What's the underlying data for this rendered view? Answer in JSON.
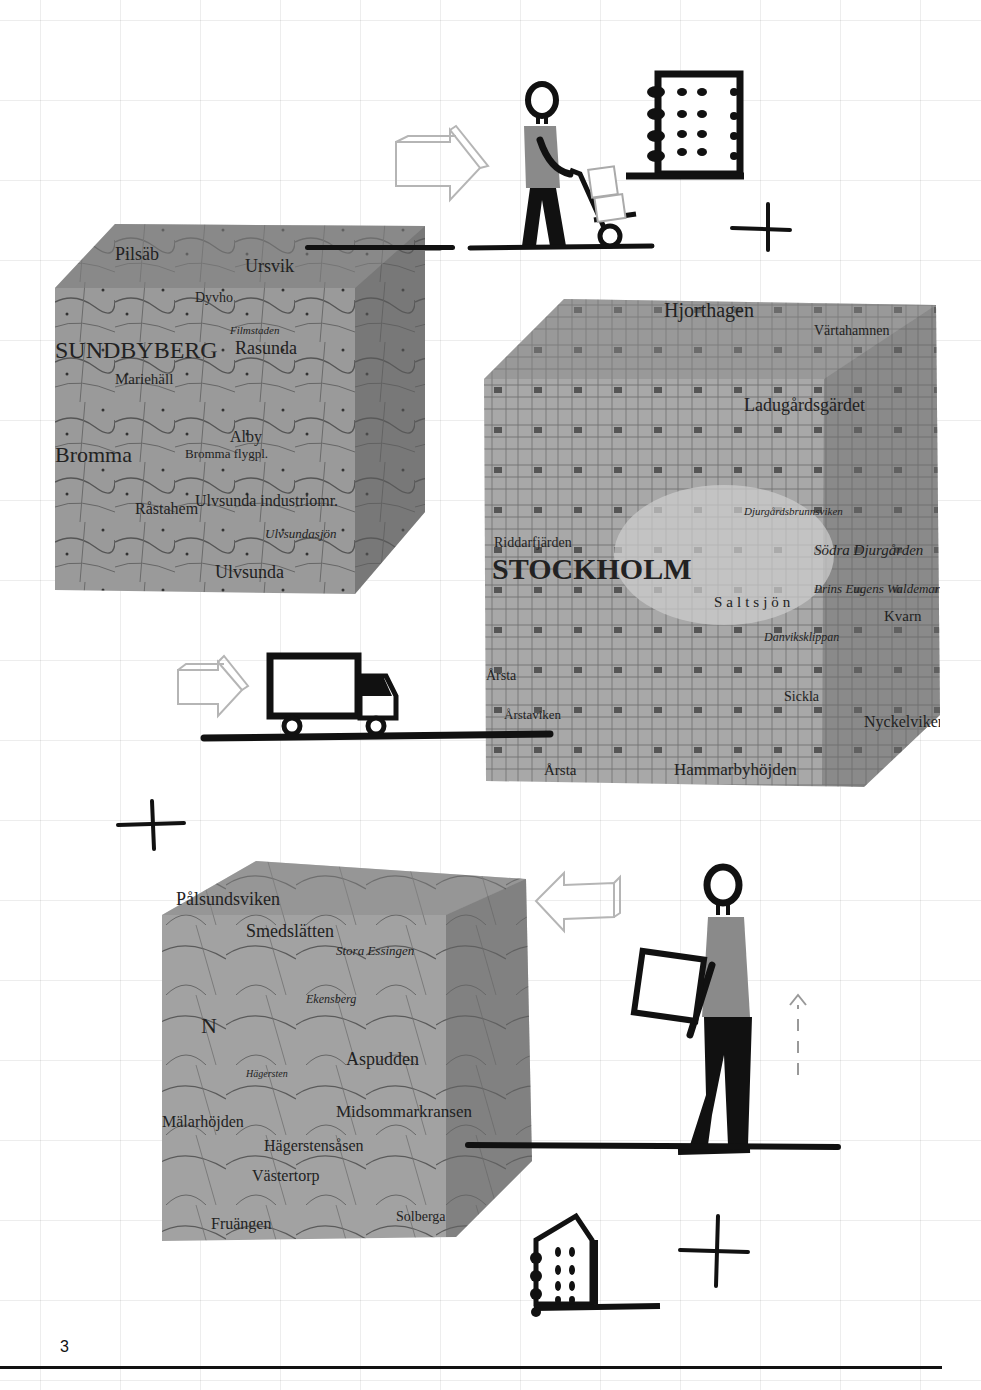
{
  "page": {
    "number": "3",
    "background": "#ffffff",
    "grid_color": "#e6e6e6",
    "ink_color": "#111111",
    "map_tone": "#8c8c8c",
    "arrow_outline_color": "#b5b5b5"
  },
  "cubes": [
    {
      "id": "bromma",
      "labels": [
        "Ulvsunda",
        "Bromma",
        "Mariehäll",
        "SUNDBYBERG",
        "Rasunda",
        "Ulvsunda industriomr.",
        "Alby",
        "Bromma flygpl.",
        "Filmstaden",
        "Dyvho",
        "Råstahem",
        "Ursvik",
        "Ulvsundasjön",
        "Pilsäb"
      ]
    },
    {
      "id": "stockholm",
      "labels": [
        "STOCKHOLM",
        "Hjorthagen",
        "Värtahamnen",
        "Ladugårdsgärdet",
        "Riddarfjärden",
        "Saltsjön",
        "Södra Djurgården",
        "Prins Eugens Waldemarsudde",
        "Djurgårdsbrunnsviken",
        "Danviksklippan",
        "Sickla",
        "Nyckelviken",
        "Hammarbyhöjden",
        "Årsta",
        "Årstaviken",
        "Kvarn"
      ]
    },
    {
      "id": "hagersten",
      "labels": [
        "Smedslätten",
        "Stora Essingen",
        "Ekensberg",
        "Aspudden",
        "Midsommarkransen",
        "Hägerstensåsen",
        "Västertorp",
        "Mälarhöjden",
        "Fruängen",
        "Solberga",
        "Hägersten",
        "Pålsundsviken",
        "N"
      ]
    }
  ],
  "scenes": [
    {
      "id": "trolley-worker",
      "description": "person pushing hand trolley with boxes toward building",
      "arrow": "right"
    },
    {
      "id": "delivery-truck",
      "description": "box truck on ground line",
      "arrow": "right"
    },
    {
      "id": "box-lifter",
      "description": "person lifting box",
      "arrow": "left",
      "lift_indicator": "dashed-up-arrow"
    }
  ],
  "plus_marks": 3,
  "buildings": 2
}
